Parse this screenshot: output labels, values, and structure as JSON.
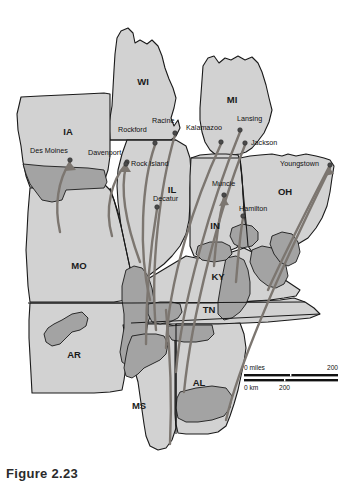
{
  "figure": {
    "caption": "Figure 2.23",
    "alt_title": "Migration flow map of the U.S. Midwest and Mid-South"
  },
  "map": {
    "colors": {
      "state_fill": "#d2d2d2",
      "highlight_fill": "#a3a3a3",
      "water_fill": "#ffffff",
      "outline": "#1a1a1a",
      "flow_line": "#7c7670",
      "background": "#ffffff"
    },
    "states": [
      {
        "code": "WI",
        "name": "Wisconsin",
        "x": 143,
        "y": 82
      },
      {
        "code": "MI",
        "name": "Michigan",
        "x": 232,
        "y": 100
      },
      {
        "code": "IA",
        "name": "Iowa",
        "x": 68,
        "y": 132
      },
      {
        "code": "IL",
        "name": "Illinois",
        "x": 172,
        "y": 190
      },
      {
        "code": "IN",
        "name": "Indiana",
        "x": 215,
        "y": 226
      },
      {
        "code": "OH",
        "name": "Ohio",
        "x": 285,
        "y": 192
      },
      {
        "code": "MO",
        "name": "Missouri",
        "x": 79,
        "y": 266
      },
      {
        "code": "KY",
        "name": "Kentucky",
        "x": 218,
        "y": 277
      },
      {
        "code": "TN",
        "name": "Tennessee",
        "x": 209,
        "y": 310
      },
      {
        "code": "AR",
        "name": "Arkansas",
        "x": 74,
        "y": 355
      },
      {
        "code": "MS",
        "name": "Mississippi",
        "x": 139,
        "y": 406
      },
      {
        "code": "AL",
        "name": "Alabama",
        "x": 199,
        "y": 383
      }
    ],
    "cities": [
      {
        "name": "Des Moines",
        "dot_x": 70,
        "dot_y": 160,
        "label_x": 30,
        "label_y": 153,
        "anchor": "start"
      },
      {
        "name": "Davenport",
        "dot_x": 127,
        "dot_y": 162,
        "label_x": 88,
        "label_y": 155,
        "anchor": "start"
      },
      {
        "name": "Rock Island",
        "dot_x": 126,
        "dot_y": 164,
        "label_x": 131,
        "label_y": 166,
        "anchor": "start"
      },
      {
        "name": "Rockford",
        "dot_x": 155,
        "dot_y": 143,
        "label_x": 118,
        "label_y": 132,
        "anchor": "start"
      },
      {
        "name": "Racine",
        "dot_x": 175,
        "dot_y": 133,
        "label_x": 152,
        "label_y": 123,
        "anchor": "start"
      },
      {
        "name": "Kalamazoo",
        "dot_x": 221,
        "dot_y": 142,
        "label_x": 186,
        "label_y": 130,
        "anchor": "start"
      },
      {
        "name": "Lansing",
        "dot_x": 240,
        "dot_y": 130,
        "label_x": 237,
        "label_y": 121,
        "anchor": "start"
      },
      {
        "name": "Jackson",
        "dot_x": 245,
        "dot_y": 143,
        "label_x": 251,
        "label_y": 145,
        "anchor": "start"
      },
      {
        "name": "Youngstown",
        "dot_x": 330,
        "dot_y": 165,
        "label_x": 280,
        "label_y": 166,
        "anchor": "start"
      },
      {
        "name": "Muncie",
        "dot_x": 224,
        "dot_y": 195,
        "label_x": 212,
        "label_y": 186,
        "anchor": "start"
      },
      {
        "name": "Hamilton",
        "dot_x": 243,
        "dot_y": 216,
        "label_x": 239,
        "label_y": 211,
        "anchor": "start"
      },
      {
        "name": "Decatur",
        "dot_x": 157,
        "dot_y": 207,
        "label_x": 153,
        "label_y": 201,
        "anchor": "start"
      }
    ],
    "scale_bar": {
      "miles_label": "0 miles",
      "miles_max": "200",
      "km_label": "0 km",
      "km_max": "200"
    }
  },
  "chart_data": {
    "type": "map",
    "legend": [],
    "flows": [
      {
        "from": "Mississippi Delta",
        "to": "Des Moines"
      },
      {
        "from": "Mississippi Delta",
        "to": "Davenport"
      },
      {
        "from": "Mississippi Delta",
        "to": "Rock Island"
      },
      {
        "from": "Mississippi Delta",
        "to": "Rockford"
      },
      {
        "from": "Mississippi Delta",
        "to": "Racine"
      },
      {
        "from": "Mississippi Delta",
        "to": "Kalamazoo"
      },
      {
        "from": "Mississippi Delta",
        "to": "Lansing"
      },
      {
        "from": "Mississippi Delta",
        "to": "Jackson"
      },
      {
        "from": "Appalachia",
        "to": "Muncie"
      },
      {
        "from": "Appalachia",
        "to": "Hamilton"
      },
      {
        "from": "Appalachia",
        "to": "Youngstown"
      },
      {
        "from": "Alabama Black Belt",
        "to": "Decatur"
      }
    ]
  }
}
